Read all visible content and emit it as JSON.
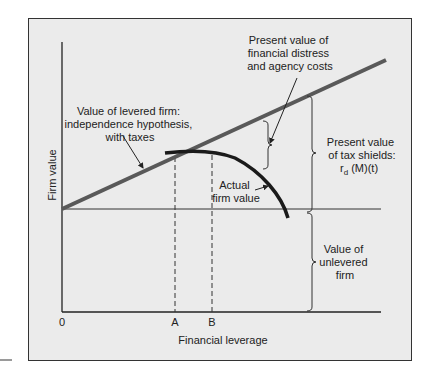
{
  "diagram": {
    "x_axis_label": "Financial leverage",
    "y_axis_label": "Firm value",
    "tick_labels": {
      "origin": "0",
      "a": "A",
      "b": "B"
    },
    "annotations": {
      "levered_line": [
        "Value of levered firm:",
        "independence hypothesis,",
        "with taxes"
      ],
      "distress_costs": [
        "Present value of",
        "financial distress",
        "and agency costs"
      ],
      "tax_shields": [
        "Present value",
        "of tax shields:"
      ],
      "tax_shields_formula": {
        "r": "r",
        "sub": "d",
        "rest": " (M)(t)"
      },
      "actual_value": [
        "Actual",
        "firm value"
      ],
      "unlevered": [
        "Value of",
        "unlevered",
        "firm"
      ]
    },
    "colors": {
      "levered_line": "#595959",
      "curve": "#1a1a1a",
      "background": "#ebebeb"
    }
  }
}
